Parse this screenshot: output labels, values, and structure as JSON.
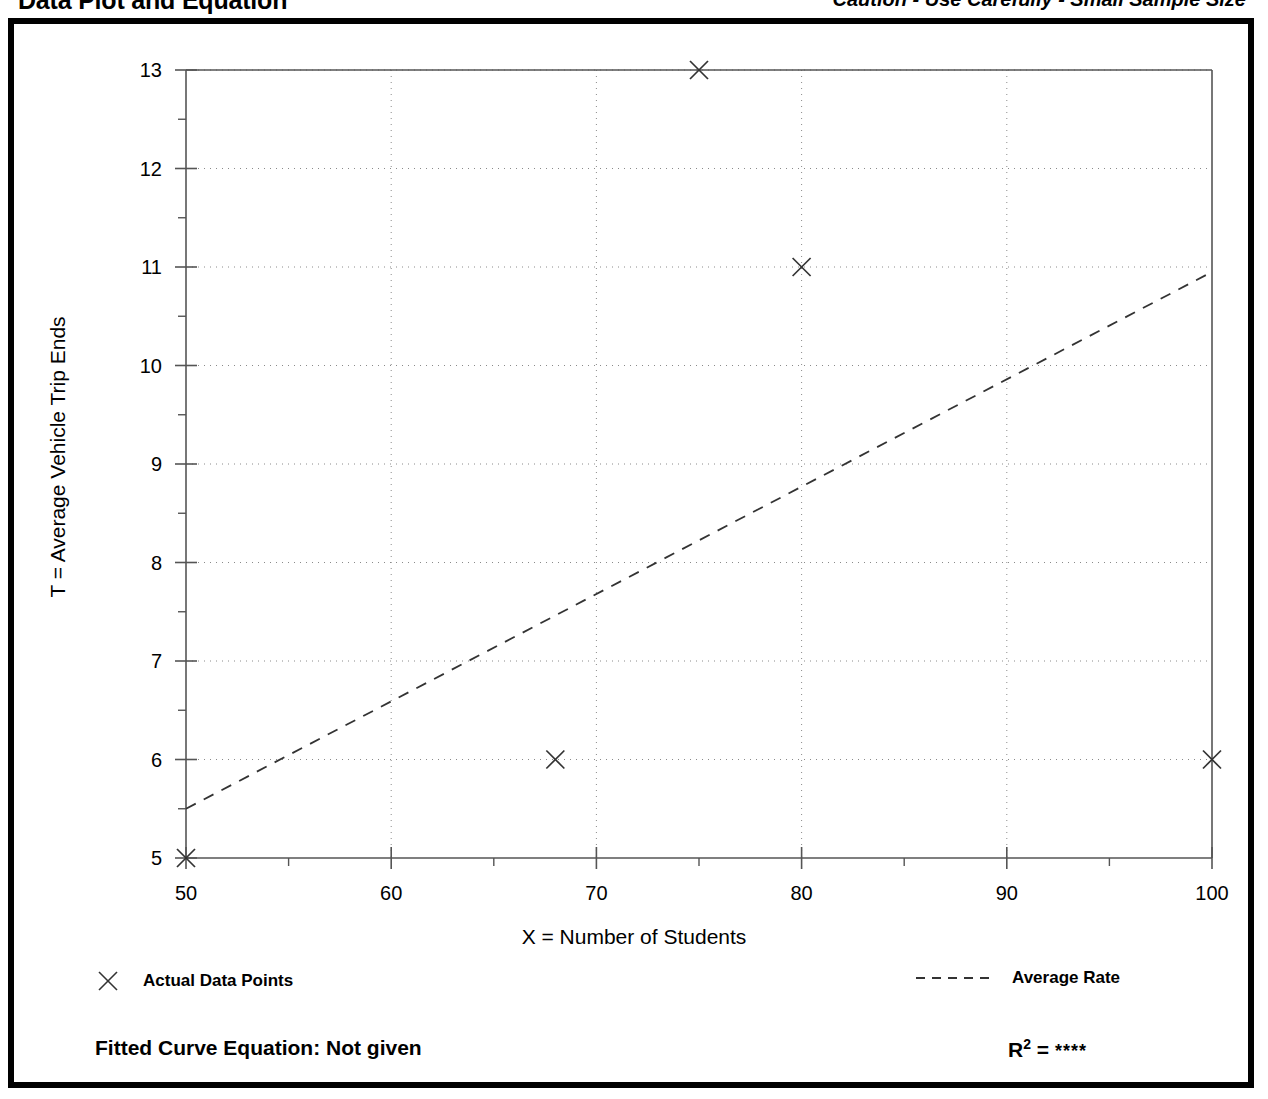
{
  "header": {
    "title": "Data Plot and Equation",
    "caution": "Caution - Use Carefully - Small Sample Size"
  },
  "legend": {
    "points_label": "Actual Data Points",
    "points_marker": "x-marker-icon",
    "rate_label": "Average Rate",
    "rate_marker": "dashed-line-icon"
  },
  "equation": {
    "fitted_label": "Fitted Curve Equation:  Not given",
    "r2_label": "R",
    "r2_exponent": "2",
    "r2_equals": " = ",
    "r2_value": "****"
  },
  "colors": {
    "ink": "#000000",
    "grid": "#8a8a8a",
    "axis": "#555555",
    "background": "#ffffff"
  },
  "chart_data": {
    "type": "scatter",
    "title": "Data Plot and Equation",
    "xlabel": "X = Number of Students",
    "ylabel": "T = Average Vehicle Trip Ends",
    "xlim": [
      50,
      100
    ],
    "ylim": [
      5,
      13
    ],
    "xticks": [
      50,
      60,
      70,
      80,
      90,
      100
    ],
    "yticks": [
      5,
      6,
      7,
      8,
      9,
      10,
      11,
      12,
      13
    ],
    "xminor_step": 5,
    "yminor_step": 0.5,
    "grid": "dotted",
    "legend_position": "below-plot",
    "series": [
      {
        "name": "Actual Data Points",
        "type": "scatter",
        "marker": "x",
        "points": [
          {
            "x": 50,
            "y": 5
          },
          {
            "x": 68,
            "y": 6
          },
          {
            "x": 75,
            "y": 13
          },
          {
            "x": 80,
            "y": 11
          },
          {
            "x": 100,
            "y": 6
          }
        ]
      },
      {
        "name": "Average Rate",
        "type": "line",
        "style": "dashed",
        "points": [
          {
            "x": 50,
            "y": 5.5
          },
          {
            "x": 100,
            "y": 10.95
          }
        ]
      }
    ],
    "annotations": {
      "fitted_curve_equation": "Not given",
      "r_squared": "****",
      "caution": "Caution - Use Carefully - Small Sample Size"
    }
  }
}
